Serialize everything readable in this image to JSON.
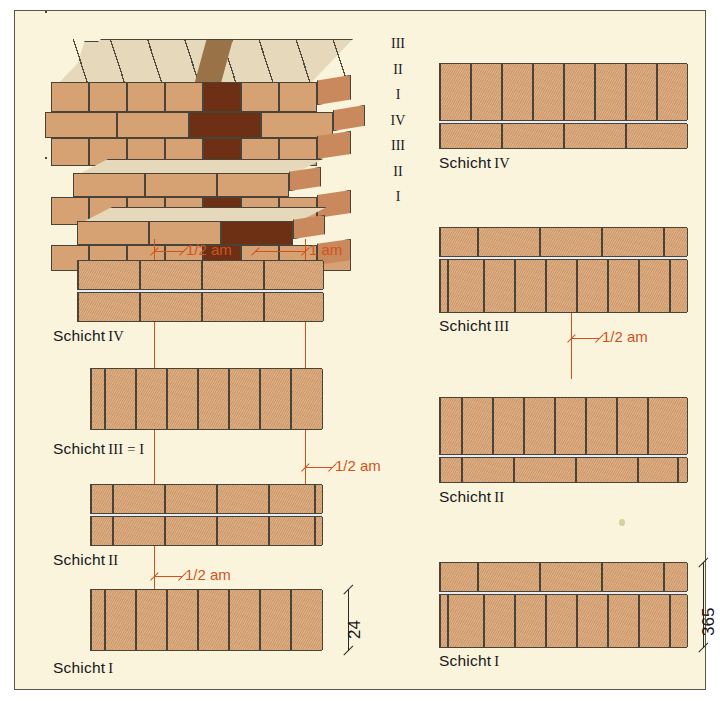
{
  "figure": {
    "background_color": "#faf4dc",
    "brick_color": "#d6a273",
    "brick_dark_color": "#7a3a18",
    "brick_top_color": "#e6d8ba",
    "dimension_color": "#d2521c",
    "outline_color": "#4a4438"
  },
  "iso": {
    "caption": "3D-Darstellung Mauerwerksverband",
    "course_labels": [
      "III",
      "II",
      "I",
      "IV",
      "III",
      "II",
      "I"
    ]
  },
  "left_column": {
    "diagrams": [
      {
        "label": "Schicht",
        "numeral": "IV",
        "dimensions": [
          "1/2 am",
          "1 am"
        ]
      },
      {
        "label": "Schicht",
        "numeral": "III = I",
        "dimensions": [
          "1/2 am"
        ]
      },
      {
        "label": "Schicht",
        "numeral": "II",
        "dimensions": [
          "1/2 am"
        ]
      },
      {
        "label": "Schicht",
        "numeral": "I",
        "dimensions": [],
        "thickness": "24"
      }
    ]
  },
  "right_column": {
    "diagrams": [
      {
        "label": "Schicht",
        "numeral": "IV",
        "dimensions": []
      },
      {
        "label": "Schicht",
        "numeral": "III",
        "dimensions": [
          "1/2 am"
        ]
      },
      {
        "label": "Schicht",
        "numeral": "II",
        "dimensions": []
      },
      {
        "label": "Schicht",
        "numeral": "I",
        "dimensions": [],
        "thickness": "365"
      }
    ]
  },
  "dimension_labels": {
    "half_am": "1/2 am",
    "one_am": "1 am",
    "thickness_24": "24",
    "thickness_365": "365"
  }
}
